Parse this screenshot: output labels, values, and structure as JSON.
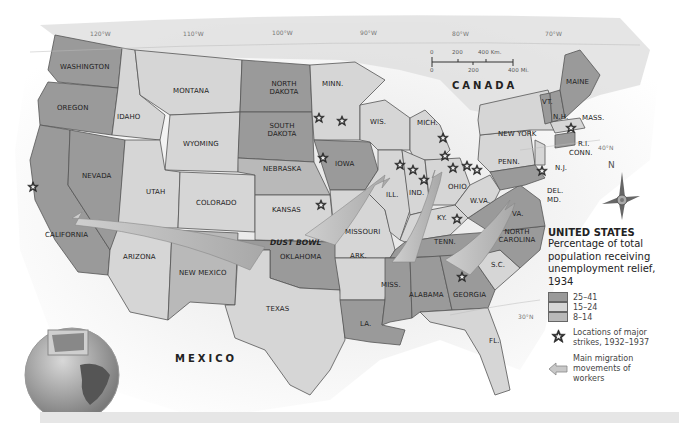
{
  "map": {
    "title": "UNITED STATES",
    "subtitle": "Percentage of total population receiving unemployment relief, 1934",
    "colors": {
      "high": "#9a9a9a",
      "mid": "#d6d6d6",
      "low": "#b9b9b9",
      "land": "#e2e2e2",
      "water": "#f4f4f4"
    },
    "countries": {
      "canada": "CANADA",
      "mexico": "MEXICO"
    },
    "region_label": "DUST BOWL",
    "gridlines": {
      "lon_120": "120°W",
      "lon_110": "110°W",
      "lon_100": "100°W",
      "lon_90": "90°W",
      "lon_80": "80°W",
      "lon_70": "70°W",
      "lat_40": "40°N",
      "lat_30": "30°N"
    },
    "scale": {
      "km_0": "0",
      "km_200": "200",
      "km_400": "400 Km.",
      "mi_0": "0",
      "mi_200": "200",
      "mi_400": "400 Mi."
    },
    "compass": {
      "north": "N"
    },
    "states": {
      "washington": "WASHINGTON",
      "oregon": "OREGON",
      "idaho": "IDAHO",
      "montana": "MONTANA",
      "wyoming": "WYOMING",
      "nevada": "NEVADA",
      "california": "CALIFORNIA",
      "utah": "UTAH",
      "colorado": "COLORADO",
      "arizona": "ARIZONA",
      "new_mexico": "NEW MEXICO",
      "texas": "TEXAS",
      "north_dakota": "NORTH DAKOTA",
      "south_dakota": "SOUTH DAKOTA",
      "nebraska": "NEBRASKA",
      "kansas": "KANSAS",
      "oklahoma": "OKLAHOMA",
      "minn": "MINN.",
      "iowa": "IOWA",
      "missouri": "MISSOURI",
      "ark": "ARK.",
      "la": "LA.",
      "wis": "WIS.",
      "ill": "ILL.",
      "mich": "MICH.",
      "ind": "IND.",
      "ohio": "OHIO",
      "ky": "KY.",
      "tenn": "TENN.",
      "miss": "MISS.",
      "alabama": "ALABAMA",
      "georgia": "GEORGIA",
      "fl": "FL.",
      "sc": "S.C.",
      "north_carolina": "NORTH CAROLINA",
      "va": "VA.",
      "wva": "W.VA.",
      "penn": "PENN.",
      "new_york": "NEW YORK",
      "nj": "N.J.",
      "del": "DEL.",
      "md": "MD.",
      "conn": "CONN.",
      "ri": "R.I.",
      "mass": "MASS.",
      "vt": "VT.",
      "nh": "N.H.",
      "maine": "MAINE"
    },
    "legend": {
      "categories": [
        {
          "range": "25–41",
          "color": "#9a9a9a"
        },
        {
          "range": "15–24",
          "color": "#d6d6d6"
        },
        {
          "range": "8–14",
          "color": "#b9b9b9"
        }
      ],
      "strikes_label": "Locations of major strikes, 1932–1937",
      "migration_label": "Main migration movements of workers"
    }
  }
}
